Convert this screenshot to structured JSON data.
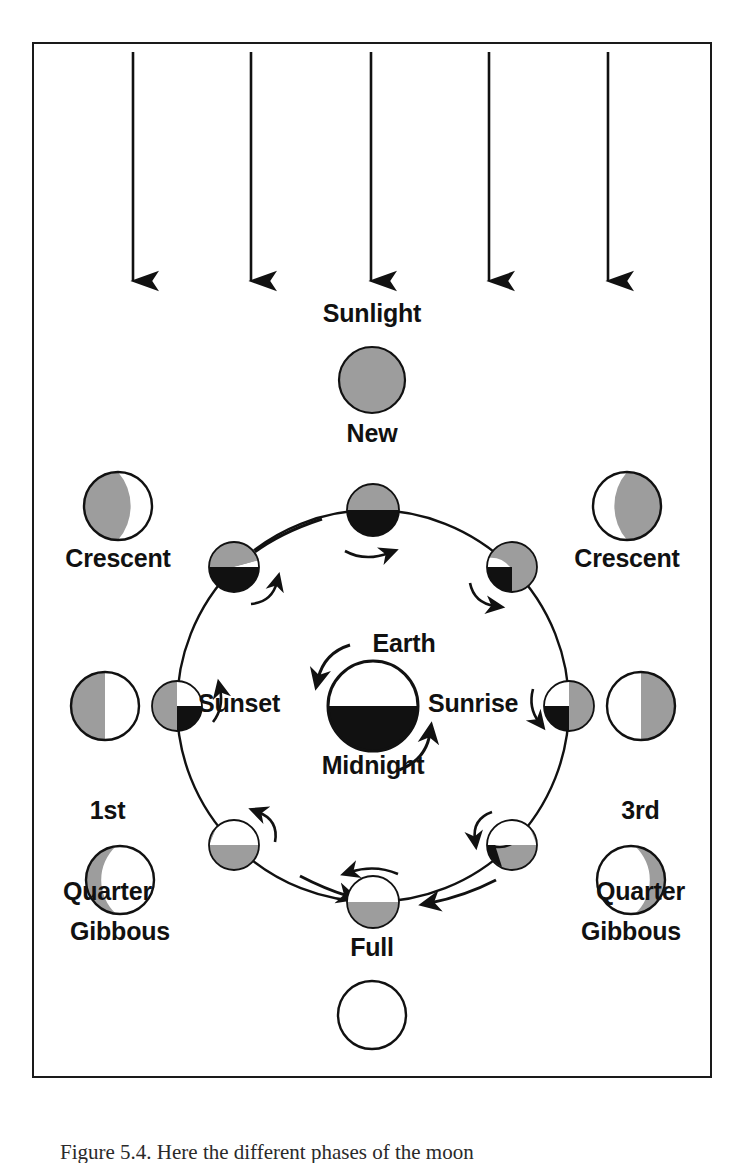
{
  "figure": {
    "caption": "Figure 5.4. Here the different phases of the moon",
    "sunlight_label": "Sunlight",
    "arrow_count": 5,
    "border_color": "#1a1a1a",
    "background_color": "#ffffff"
  },
  "colors": {
    "lit_gray": "#9d9d9d",
    "dark_black": "#111111",
    "unlit_white": "#ffffff",
    "outline": "#111111",
    "text": "#111111"
  },
  "earth": {
    "label": "Earth",
    "sunset_label": "Sunset",
    "sunrise_label": "Sunrise",
    "midnight_label": "Midnight",
    "center_x": 373,
    "center_y": 706,
    "radius": 45,
    "top_half": "white",
    "bottom_half": "black"
  },
  "orbit": {
    "center_x": 373,
    "center_y": 706,
    "radius": 196,
    "direction": "counterclockwise"
  },
  "sun_arrows": [
    {
      "x": 133,
      "top": 52,
      "bottom": 288
    },
    {
      "x": 251,
      "top": 52,
      "bottom": 288
    },
    {
      "x": 371,
      "top": 52,
      "bottom": 288
    },
    {
      "x": 489,
      "top": 52,
      "bottom": 288
    },
    {
      "x": 608,
      "top": 52,
      "bottom": 288
    }
  ],
  "orbit_moons": [
    {
      "name": "new-position",
      "angle_deg": 90,
      "x": 373,
      "y": 510,
      "r": 26,
      "pattern": "gray-top-black-bottom"
    },
    {
      "name": "waxing-crescent",
      "angle_deg": 135,
      "x": 234,
      "y": 567,
      "r": 25,
      "pattern": "gray-left-white-wedge-black-bottom"
    },
    {
      "name": "first-quarter",
      "angle_deg": 180,
      "x": 177,
      "y": 706,
      "r": 25,
      "pattern": "gray-left-white-topright-black-bottomright"
    },
    {
      "name": "waxing-gibbous",
      "angle_deg": 225,
      "x": 234,
      "y": 845,
      "r": 25,
      "pattern": "white-top-gray-bottom-diag"
    },
    {
      "name": "full-position",
      "angle_deg": 270,
      "x": 373,
      "y": 902,
      "r": 26,
      "pattern": "white-top-gray-bottom"
    },
    {
      "name": "waning-gibbous",
      "angle_deg": 315,
      "x": 512,
      "y": 845,
      "r": 25,
      "pattern": "white-top-gray-bottom-diag-mirror"
    },
    {
      "name": "third-quarter",
      "angle_deg": 0,
      "x": 569,
      "y": 706,
      "r": 25,
      "pattern": "gray-right-white-topleft-black-bottomleft"
    },
    {
      "name": "waning-crescent",
      "angle_deg": 45,
      "x": 512,
      "y": 567,
      "r": 25,
      "pattern": "gray-right-white-wedge-black-bottom"
    }
  ],
  "phase_labels": [
    {
      "id": "new",
      "text": "New",
      "x": 372,
      "y": 420,
      "align": "center"
    },
    {
      "id": "crescent-left",
      "text": "Crescent",
      "x": 118,
      "y": 545,
      "align": "center"
    },
    {
      "id": "crescent-right",
      "text": "Crescent",
      "x": 627,
      "y": 545,
      "align": "center"
    },
    {
      "id": "first-quarter",
      "text": "1st\nQuarter",
      "x": 75,
      "y": 745,
      "align": "left"
    },
    {
      "id": "third-quarter",
      "text": "3rd\nQuarter",
      "x": 637,
      "y": 745,
      "align": "left"
    },
    {
      "id": "gibbous-left",
      "text": "Gibbous",
      "x": 120,
      "y": 918,
      "align": "center"
    },
    {
      "id": "gibbous-right",
      "text": "Gibbous",
      "x": 631,
      "y": 918,
      "align": "center"
    },
    {
      "id": "full",
      "text": "Full",
      "x": 372,
      "y": 934,
      "align": "center"
    }
  ],
  "appearance_moons": [
    {
      "id": "new-appearance",
      "label": "New",
      "x": 372,
      "y": 380,
      "r": 33,
      "pattern": "all-gray"
    },
    {
      "id": "crescent-left-appearance",
      "label": "Crescent",
      "x": 118,
      "y": 506,
      "r": 34,
      "pattern": "gray-with-white-crescent-right"
    },
    {
      "id": "crescent-right-appearance",
      "label": "Crescent",
      "x": 627,
      "y": 506,
      "r": 34,
      "pattern": "gray-with-white-crescent-left"
    },
    {
      "id": "first-quarter-appearance",
      "label": "1st Quarter",
      "x": 105,
      "y": 706,
      "r": 34,
      "pattern": "gray-left-white-right"
    },
    {
      "id": "third-quarter-appearance",
      "label": "3rd Quarter",
      "x": 641,
      "y": 706,
      "r": 34,
      "pattern": "white-left-gray-right"
    },
    {
      "id": "gibbous-left-appearance",
      "label": "Gibbous",
      "x": 120,
      "y": 880,
      "r": 34,
      "pattern": "white-with-thin-gray-left"
    },
    {
      "id": "gibbous-right-appearance",
      "label": "Gibbous",
      "x": 631,
      "y": 880,
      "r": 34,
      "pattern": "white-with-thin-gray-right"
    },
    {
      "id": "full-appearance",
      "label": "Full",
      "x": 372,
      "y": 1015,
      "r": 34,
      "pattern": "all-white"
    }
  ],
  "rotation_arrows": [
    {
      "near": "new-position",
      "cx": 373,
      "cy": 552,
      "sweep": "cw"
    },
    {
      "near": "waxing-crescent",
      "cx": 270,
      "cy": 596,
      "sweep": "ccw"
    },
    {
      "near": "first-quarter",
      "cx": 218,
      "cy": 700,
      "sweep": "ccw"
    },
    {
      "near": "waxing-gibbous",
      "cx": 270,
      "cy": 820,
      "sweep": "ccw"
    },
    {
      "near": "full-position",
      "cx": 373,
      "cy": 872,
      "sweep": "ccw"
    },
    {
      "near": "waning-gibbous",
      "cx": 478,
      "cy": 820,
      "sweep": "cw"
    },
    {
      "near": "third-quarter",
      "cx": 528,
      "cy": 700,
      "sweep": "cw"
    },
    {
      "near": "waning-crescent",
      "cx": 478,
      "cy": 596,
      "sweep": "cw"
    }
  ],
  "orbit_direction_arrows": [
    {
      "at_angle_deg": 113,
      "label": "orbit-arrow-top-left"
    },
    {
      "at_angle_deg": 250,
      "label": "orbit-arrow-bottom-left"
    },
    {
      "at_angle_deg": 293,
      "label": "orbit-arrow-bottom-right"
    }
  ]
}
